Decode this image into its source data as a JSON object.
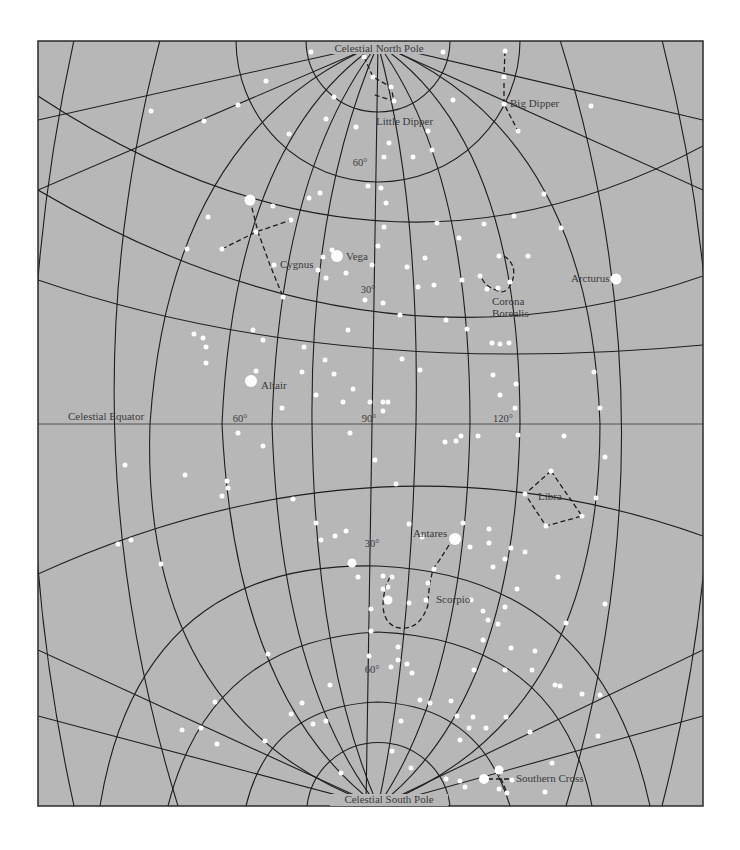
{
  "map": {
    "background": "#b7b7b7",
    "frame_color": "#2a2a2a",
    "star_color": "#ffffff",
    "grid_color": "#1e1e1e"
  },
  "poles": {
    "north": "Celestial North Pole",
    "south": "Celestial South Pole"
  },
  "equator_label": "Celestial Equator",
  "degree_labels": {
    "n60": "60°",
    "n30": "30°",
    "eq60": "60°",
    "eq90": "90°",
    "eq120": "120°",
    "s30": "30°",
    "s60": "60°"
  },
  "constellations": {
    "little_dipper": "Little Dipper",
    "big_dipper": "Big Dipper",
    "cygnus": "Cygnus",
    "corona_line1": "Corona",
    "corona_line2": "Borealis",
    "libra": "Libra",
    "scorpio": "Scorpio",
    "southern_cross": "Southern Cross"
  },
  "named_stars": {
    "vega": "Vega",
    "arcturus": "Arcturus",
    "altair": "Altair",
    "antares": "Antares"
  }
}
